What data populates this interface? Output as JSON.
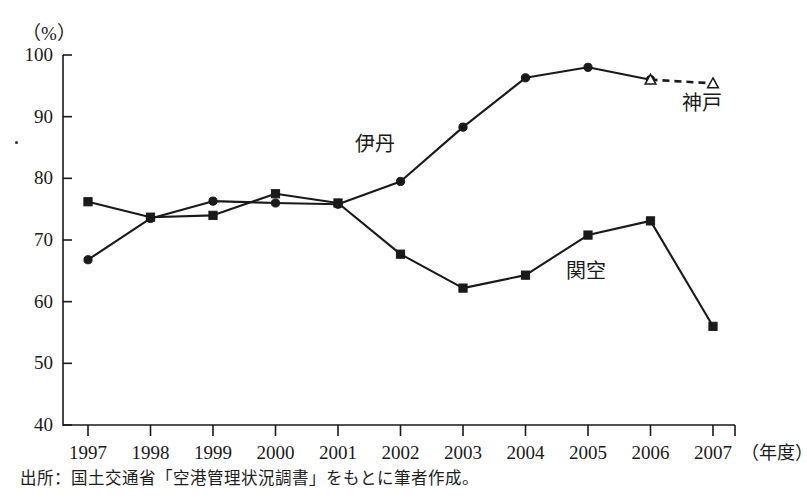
{
  "figure": {
    "y_axis_unit": "（%）",
    "x_axis_unit": "（年度）",
    "source_note": "出所：国土交通省「空港管理状況調書」をもとに筆者作成。",
    "line_color": "#1a1a1a",
    "background_color": "#ffffff"
  },
  "labels": {
    "itami": "伊丹",
    "kansai": "関空",
    "kobe": "神戸"
  },
  "chart_data": {
    "type": "line",
    "title": "",
    "subtitle": "",
    "xlabel": "（年度）",
    "ylabel": "（%）",
    "ylim": [
      40,
      100
    ],
    "xlim": [
      1997,
      2007
    ],
    "yticks": [
      40,
      50,
      60,
      70,
      80,
      90,
      100
    ],
    "ytick_labels": [
      "40",
      "50",
      "60",
      "70",
      "80",
      "90",
      "100"
    ],
    "grid": false,
    "legend": "inline-annotations",
    "categories": [
      1997,
      1998,
      1999,
      2000,
      2001,
      2002,
      2003,
      2004,
      2005,
      2006,
      2007
    ],
    "xtick_labels": [
      "1997",
      "1998",
      "1999",
      "2000",
      "2001",
      "2002",
      "2003",
      "2004",
      "2005",
      "2006",
      "2007"
    ],
    "series": [
      {
        "name": "伊丹",
        "marker": "filled-circle",
        "linestyle": "solid",
        "color": "#1a1a1a",
        "x": [
          1997,
          1998,
          1999,
          2000,
          2001,
          2002,
          2003,
          2004,
          2005,
          2006
        ],
        "values": [
          66.8,
          73.5,
          76.3,
          76.0,
          75.8,
          79.5,
          88.3,
          96.3,
          98.0,
          96.0
        ]
      },
      {
        "name": "関空",
        "marker": "filled-square",
        "linestyle": "solid",
        "color": "#1a1a1a",
        "x": [
          1997,
          1998,
          1999,
          2000,
          2001,
          2002,
          2003,
          2004,
          2005,
          2006,
          2007
        ],
        "values": [
          76.2,
          73.7,
          74.0,
          77.5,
          76.0,
          67.7,
          62.2,
          64.3,
          70.8,
          73.1,
          56.0
        ]
      },
      {
        "name": "神戸",
        "marker": "open-triangle",
        "linestyle": "dashed",
        "color": "#1a1a1a",
        "x": [
          2006,
          2007
        ],
        "values": [
          96.0,
          95.4
        ]
      }
    ],
    "annotations": [
      {
        "text": "伊丹",
        "x": 2002,
        "y": 85.5
      },
      {
        "text": "関空",
        "x": 2005,
        "y": 65.0
      },
      {
        "text": "神戸",
        "x": 2006.6,
        "y": 92.2
      }
    ]
  }
}
